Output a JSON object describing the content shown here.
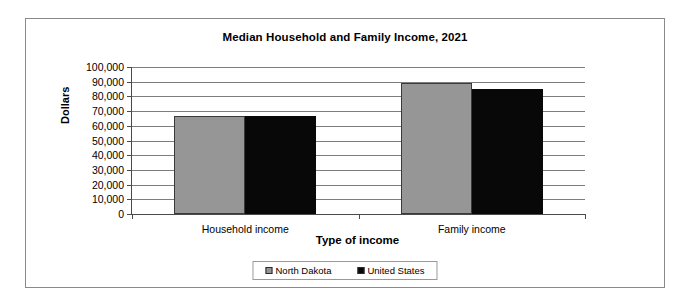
{
  "chart_data": {
    "type": "bar",
    "title": "Median Household and Family Income, 2021",
    "xlabel": "Type of income",
    "ylabel": "Dollars",
    "categories": [
      "Household income",
      "Family income"
    ],
    "series": [
      {
        "name": "North Dakota",
        "color": "#969696",
        "values": [
          66500,
          89000
        ]
      },
      {
        "name": "United States",
        "color": "#080808",
        "values": [
          67000,
          85000
        ]
      }
    ],
    "ylim": [
      0,
      100000
    ],
    "ytick_labels": [
      "100,000",
      "90,000",
      "80,000",
      "70,000",
      "60,000",
      "50,000",
      "40,000",
      "30,000",
      "20,000",
      "10,000",
      "0"
    ],
    "ytick_values": [
      100000,
      90000,
      80000,
      70000,
      60000,
      50000,
      40000,
      30000,
      20000,
      10000,
      0
    ],
    "grid": true,
    "legend_position": "bottom"
  }
}
